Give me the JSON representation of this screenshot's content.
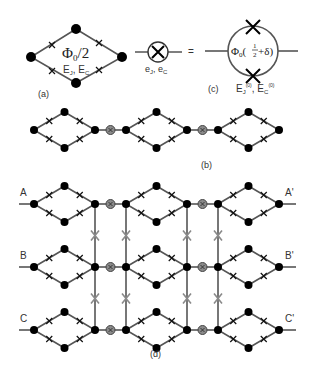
{
  "figure": {
    "panel_a": {
      "label": "(a)",
      "flux": "Φ",
      "flux_sub": "0",
      "flux_rest": "/2",
      "energies": "E",
      "energy_j_sub": "J",
      "energy_sep": ", E",
      "energy_c_sub": "C"
    },
    "panel_c": {
      "label": "(c)",
      "small_element_caption": "e",
      "small_j_sub": "J",
      "small_sep": ", e",
      "small_c_sub": "C",
      "equals": "=",
      "big_flux": "Φ",
      "big_flux_sub": "0",
      "big_open": "(",
      "big_frac_num": "1",
      "big_frac_den": "2",
      "big_rest": "+δ)",
      "big_caption_e": "E",
      "big_caption_j_sub": "J",
      "big_caption_sup": "(0)",
      "big_caption_sep": ", E",
      "big_caption_c_sub": "C"
    },
    "panel_b": {
      "label": "(b)"
    },
    "panel_d": {
      "label": "(d)",
      "rows": [
        {
          "left": "A",
          "right": "A'"
        },
        {
          "left": "B",
          "right": "B'"
        },
        {
          "left": "C",
          "right": "C'"
        }
      ]
    },
    "colors": {
      "edge": "#555555",
      "node": "#000000",
      "coupler_fill": "#8a8a8a",
      "coupler_ring": "#444444",
      "vertical_cross": "#8a8a8a"
    }
  }
}
